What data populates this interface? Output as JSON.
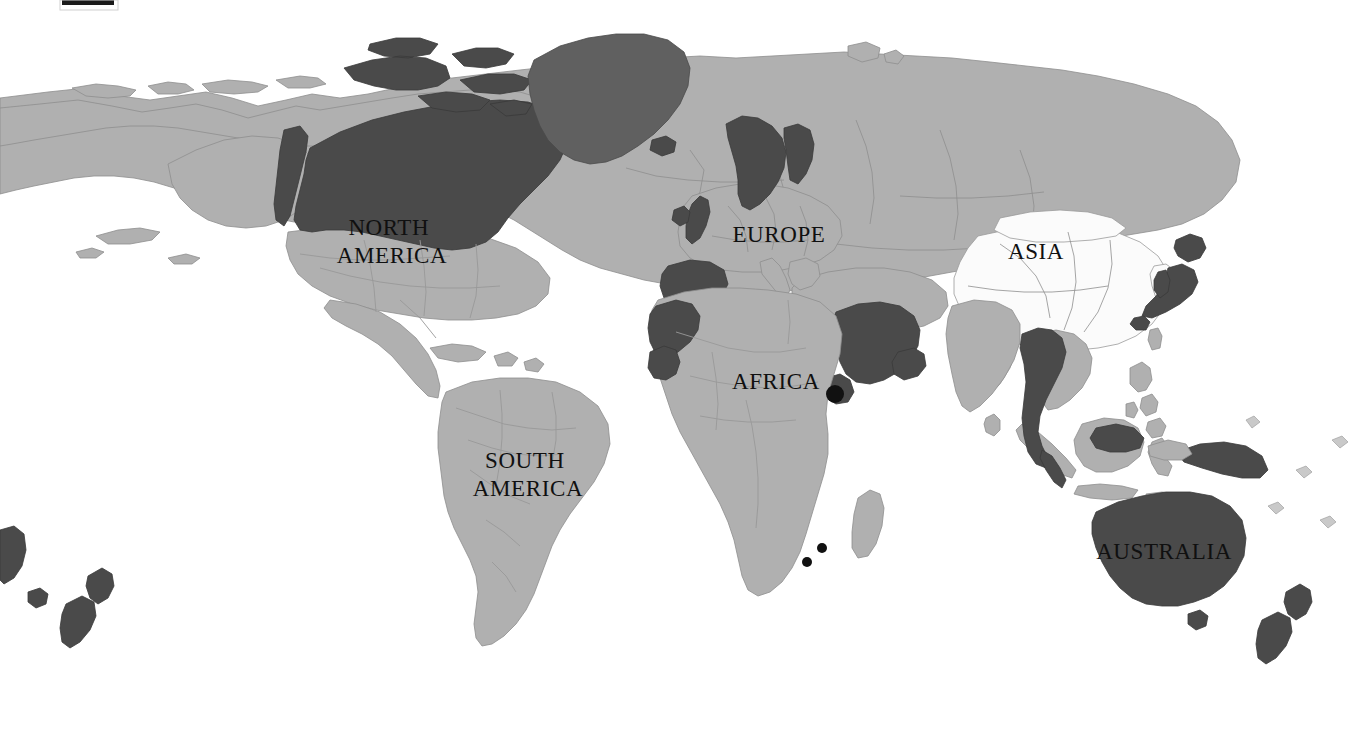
{
  "map": {
    "title": "World Map",
    "projection": "equirectangular-world",
    "background_color": "#ffffff",
    "canvas": {
      "width": 1364,
      "height": 730
    },
    "legend_shades": {
      "highlighted_dark": "#4a4a4a",
      "greenland_mid": "#606060",
      "standard_land": "#b0b0b0",
      "unshaded_white": "#fbfbfb",
      "ocean": "#ffffff"
    },
    "labels": [
      {
        "id": "north-america",
        "lines": [
          "NORTH",
          "AMERICA"
        ],
        "x": 392,
        "y": 230,
        "line_height": 28
      },
      {
        "id": "south-america",
        "lines": [
          "SOUTH",
          "AMERICA"
        ],
        "x": 528,
        "y": 463,
        "line_height": 28
      },
      {
        "id": "europe",
        "lines": [
          "EUROPE"
        ],
        "x": 779,
        "y": 237,
        "line_height": 28
      },
      {
        "id": "africa",
        "lines": [
          "AFRICA"
        ],
        "x": 776,
        "y": 384,
        "line_height": 28
      },
      {
        "id": "asia",
        "lines": [
          "ASIA"
        ],
        "x": 1036,
        "y": 254,
        "line_height": 28
      },
      {
        "id": "australia",
        "lines": [
          "AUSTRALIA"
        ],
        "x": 1164,
        "y": 554,
        "line_height": 28
      }
    ],
    "markers": [
      {
        "id": "horn-of-africa-dot",
        "x": 835,
        "y": 394,
        "r": 9,
        "color": "#111111"
      }
    ],
    "scale_bar": {
      "x": 62,
      "y": 0,
      "width": 52,
      "height": 5,
      "color": "#1a1a1a"
    },
    "highlighted_regions": [
      "Canada",
      "Greenland",
      "Alaska border strip",
      "United Kingdom",
      "Norway",
      "Sweden",
      "Spain",
      "Portugal",
      "Morocco",
      "Western Sahara",
      "Saudi Arabia",
      "Yemen",
      "Oman",
      "Eritrea",
      "Djibouti",
      "Thailand",
      "Myanmar",
      "Laos",
      "Malaysia",
      "Japan",
      "South Korea strip",
      "Australia",
      "New Zealand",
      "Lesotho",
      "Swaziland",
      "Papua New Guinea"
    ],
    "white_regions": [
      "China",
      "Mongolia fringe",
      "Korea",
      "Mediterranean inset"
    ]
  }
}
